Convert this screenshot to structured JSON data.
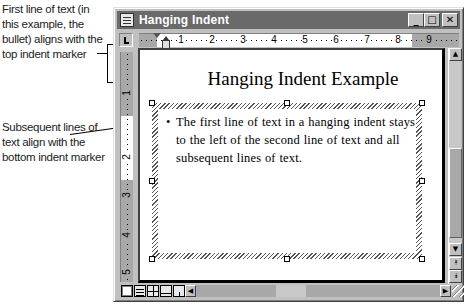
{
  "callouts": {
    "top": "First line of text (in this example, the bullet) aligns with the top indent marker",
    "bottom": "Subsequent lines of text align with the bottom indent marker"
  },
  "window": {
    "title": "Hanging Indent",
    "buttons": {
      "minimize": "_",
      "maximize": "□",
      "close": "✕"
    }
  },
  "ruler": {
    "horizontal_numbers": [
      "1",
      "2",
      "3",
      "4",
      "5",
      "6",
      "7",
      "8",
      "9"
    ],
    "vertical_numbers": [
      "1",
      "2",
      "3",
      "4",
      "5"
    ]
  },
  "document": {
    "title": "Hanging Indent Example",
    "bullet": "•",
    "paragraph": "The first line of text in a hanging indent stays to the left of the second line of text and all subsequent lines of text."
  },
  "scrollbar": {
    "up": "▲",
    "down": "▼",
    "prev_page": "⯭",
    "next_page": "⯯",
    "left": "◀",
    "right": "▶"
  },
  "view_buttons": [
    "normal-view",
    "outline-view",
    "page-layout-view",
    "online-layout-view",
    "presentation-view"
  ]
}
